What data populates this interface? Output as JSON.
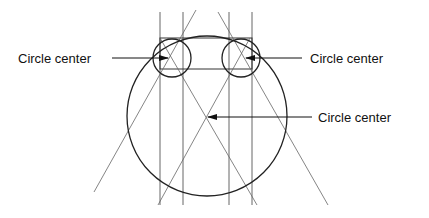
{
  "diagram": {
    "labels": [
      {
        "id": "left",
        "text": "Circle center"
      },
      {
        "id": "right",
        "text": "Circle center"
      },
      {
        "id": "main",
        "text": "Circle center"
      }
    ],
    "colors": {
      "background": "#ffffff",
      "stroke": "#222222",
      "thin": "#555555"
    }
  }
}
